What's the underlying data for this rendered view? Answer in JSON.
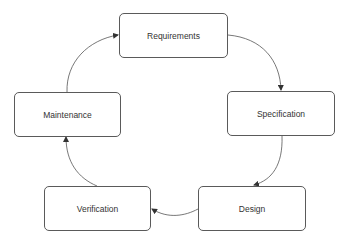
{
  "diagram": {
    "type": "cycle",
    "nodes": [
      {
        "id": "requirements",
        "label": "Requirements"
      },
      {
        "id": "specification",
        "label": "Specification"
      },
      {
        "id": "design",
        "label": "Design"
      },
      {
        "id": "verification",
        "label": "Verification"
      },
      {
        "id": "maintenance",
        "label": "Maintenance"
      }
    ],
    "edges": [
      {
        "from": "requirements",
        "to": "specification"
      },
      {
        "from": "specification",
        "to": "design"
      },
      {
        "from": "design",
        "to": "verification"
      },
      {
        "from": "verification",
        "to": "maintenance"
      },
      {
        "from": "maintenance",
        "to": "requirements"
      }
    ],
    "colors": {
      "stroke": "#5a5a5a",
      "text": "#333333",
      "background": "#ffffff"
    }
  }
}
